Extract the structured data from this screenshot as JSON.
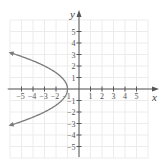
{
  "chart_data": {
    "type": "line",
    "title": "",
    "xlabel": "x",
    "ylabel": "y",
    "xlim": [
      -6,
      6
    ],
    "ylim": [
      -6,
      6
    ],
    "grid": true,
    "x_ticks": [
      -5,
      -4,
      -3,
      -2,
      -1,
      1,
      2,
      3,
      4,
      5
    ],
    "y_ticks": [
      -5,
      -4,
      -3,
      -2,
      -1,
      1,
      2,
      3,
      4,
      5
    ],
    "x_tick_labels": [
      "−5",
      "−4",
      "−3",
      "−2",
      "−1",
      "1",
      "2",
      "3",
      "4",
      "5"
    ],
    "y_tick_labels": [
      "−5",
      "−4",
      "−3",
      "−2",
      "−1",
      "1",
      "2",
      "3",
      "4",
      "5"
    ],
    "series": [
      {
        "name": "parabola opening left",
        "equation": "x = -y^2/2 - 1",
        "vertex": [
          -1,
          0
        ],
        "points": [
          [
            -6.1,
            3.2
          ],
          [
            -5.5,
            3
          ],
          [
            -3,
            2
          ],
          [
            -1.5,
            1
          ],
          [
            -1,
            0
          ],
          [
            -1.5,
            -1
          ],
          [
            -3,
            -2
          ],
          [
            -5.5,
            -3
          ],
          [
            -6.1,
            -3.2
          ]
        ],
        "arrows_at_ends": true,
        "color": "#7a7a7a"
      }
    ]
  },
  "colors": {
    "axis": "#555555",
    "grid": "#ececec",
    "curve": "#7a7a7a"
  },
  "labels": {
    "x_axis": "x",
    "y_axis": "y"
  }
}
